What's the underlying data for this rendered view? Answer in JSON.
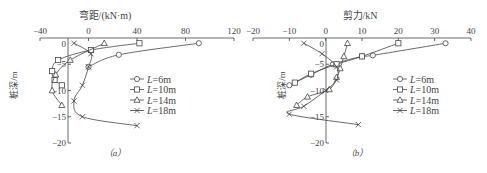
{
  "chart_data": [
    {
      "type": "line",
      "panel_label": "(a)",
      "title": "弯距/(kN·m)",
      "xlabel": "弯距/(kN·m)",
      "ylabel": "桩深/m",
      "xlim": [
        -40,
        120
      ],
      "ylim": [
        -20,
        0
      ],
      "xticks": [
        -40,
        0,
        40,
        80,
        120
      ],
      "yticks": [
        0,
        -5,
        -10,
        -15,
        -20
      ],
      "x_axis_position": "top",
      "grid": false,
      "legend_position": "right-middle",
      "series": [
        {
          "name": "L=6m",
          "marker": "circle",
          "points": [
            [
              91,
              -1
            ],
            [
              25,
              -3.2
            ],
            [
              0,
              -5.5
            ]
          ]
        },
        {
          "name": "L=10m",
          "marker": "square",
          "points": [
            [
              42,
              -1
            ],
            [
              2,
              -2.3
            ],
            [
              -25,
              -4.2
            ],
            [
              -30,
              -6.3
            ],
            [
              -28,
              -8
            ],
            [
              -22,
              -9
            ]
          ]
        },
        {
          "name": "L=14m",
          "marker": "triangle",
          "points": [
            [
              13,
              -1
            ],
            [
              -15,
              -4.2
            ],
            [
              -27,
              -7
            ],
            [
              -30,
              -10
            ],
            [
              -22,
              -12.8
            ]
          ]
        },
        {
          "name": "L=18m",
          "marker": "x",
          "points": [
            [
              -12,
              -1
            ],
            [
              2,
              -3
            ],
            [
              0,
              -5.5
            ],
            [
              -5,
              -9
            ],
            [
              -12,
              -12
            ],
            [
              -5,
              -15
            ],
            [
              40,
              -16.7
            ]
          ]
        }
      ]
    },
    {
      "type": "line",
      "panel_label": "(b)",
      "title": "剪力/kN",
      "xlabel": "剪力/kN",
      "ylabel": "桩深/m",
      "xlim": [
        -20,
        40
      ],
      "ylim": [
        -20,
        0
      ],
      "xticks": [
        -20,
        -10,
        0,
        10,
        20,
        30,
        40
      ],
      "yticks": [
        0,
        -5,
        -10,
        -15,
        -20
      ],
      "x_axis_position": "top",
      "grid": false,
      "legend_position": "right-middle",
      "series": [
        {
          "name": "L=6m",
          "marker": "circle",
          "points": [
            [
              33,
              -1
            ],
            [
              13,
              -3.3
            ],
            [
              10,
              -3.5
            ],
            [
              2,
              -5
            ],
            [
              -4,
              -7
            ],
            [
              -10,
              -9
            ]
          ]
        },
        {
          "name": "L=10m",
          "marker": "square",
          "points": [
            [
              20,
              -1
            ],
            [
              10,
              -3.5
            ],
            [
              3,
              -5
            ],
            [
              -4,
              -6.8
            ],
            [
              -8.5,
              -8.5
            ]
          ]
        },
        {
          "name": "L=14m",
          "marker": "triangle",
          "points": [
            [
              6,
              -1
            ],
            [
              5,
              -3.5
            ],
            [
              4,
              -5.8
            ],
            [
              3,
              -7.5
            ],
            [
              1,
              -9.8
            ],
            [
              -5,
              -11.2
            ],
            [
              -8,
              -12.8
            ]
          ]
        },
        {
          "name": "L=18m",
          "marker": "x",
          "points": [
            [
              -6,
              -1
            ],
            [
              -1,
              -3
            ],
            [
              3,
              -5.5
            ],
            [
              3,
              -8
            ],
            [
              0,
              -10
            ],
            [
              -6,
              -13
            ],
            [
              -10,
              -14.5
            ],
            [
              9,
              -16.5
            ]
          ]
        }
      ]
    }
  ],
  "panels": [
    {
      "title": "弯距/(kN·m)",
      "ylabel": "桩深/m",
      "caption": "（a）",
      "xtick_labels": [
        "-40",
        "0",
        "40",
        "80",
        "120"
      ],
      "ytick_labels": [
        "0",
        "-5",
        "-10",
        "-15",
        "-20"
      ],
      "legend": [
        "L=6m",
        "L=10m",
        "L=14m",
        "L=18m"
      ]
    },
    {
      "title": "剪力/kN",
      "ylabel": "桩深/m",
      "caption": "（b）",
      "xtick_labels": [
        "-20",
        "-10",
        "0",
        "10",
        "20",
        "30",
        "40"
      ],
      "ytick_labels": [
        "0",
        "-5",
        "-10",
        "-15",
        "-20"
      ],
      "legend": [
        "L=6m",
        "L=10m",
        "L=14m",
        "L=18m"
      ]
    }
  ],
  "colors": {
    "line": "#444444",
    "text": "#444444",
    "background": "#ffffff"
  }
}
